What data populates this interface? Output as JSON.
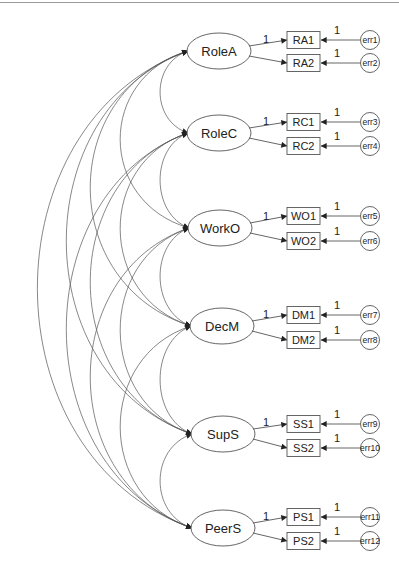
{
  "diagram": {
    "type": "structural-equation-model path diagram",
    "colors": {
      "stroke": "#555555",
      "arrow": "#222222",
      "text": "#222222",
      "background": "#ffffff"
    },
    "latents": [
      {
        "id": "RoleA",
        "label": "RoleA",
        "cx": 219,
        "cy": 51,
        "indicators": [
          {
            "label": "RA1",
            "y": 40,
            "loading": "1",
            "error": "err1",
            "error_weight": "1"
          },
          {
            "label": "RA2",
            "y": 63,
            "loading": "",
            "error": "err2",
            "error_weight": "1"
          }
        ]
      },
      {
        "id": "RoleC",
        "label": "RoleC",
        "cx": 219,
        "cy": 133,
        "indicators": [
          {
            "label": "RC1",
            "y": 122,
            "loading": "1",
            "error": "err3",
            "error_weight": "1"
          },
          {
            "label": "RC2",
            "y": 146,
            "loading": "",
            "error": "err4",
            "error_weight": "1"
          }
        ]
      },
      {
        "id": "WorkO",
        "label": "WorkO",
        "cx": 220,
        "cy": 228,
        "indicators": [
          {
            "label": "WO1",
            "y": 216,
            "loading": "1",
            "error": "err5",
            "error_weight": "1"
          },
          {
            "label": "WO2",
            "y": 241,
            "loading": "",
            "error": "err6",
            "error_weight": "1"
          }
        ]
      },
      {
        "id": "DecM",
        "label": "DecM",
        "cx": 222,
        "cy": 326,
        "indicators": [
          {
            "label": "DM1",
            "y": 315,
            "loading": "1",
            "error": "err7",
            "error_weight": "1"
          },
          {
            "label": "DM2",
            "y": 340,
            "loading": "",
            "error": "err8",
            "error_weight": "1"
          }
        ]
      },
      {
        "id": "SupS",
        "label": "SupS",
        "cx": 223,
        "cy": 434,
        "indicators": [
          {
            "label": "SS1",
            "y": 424,
            "loading": "1",
            "error": "err9",
            "error_weight": "1"
          },
          {
            "label": "SS2",
            "y": 448,
            "loading": "",
            "error": "err10",
            "error_weight": "1"
          }
        ]
      },
      {
        "id": "PeerS",
        "label": "PeerS",
        "cx": 223,
        "cy": 528,
        "indicators": [
          {
            "label": "PS1",
            "y": 517,
            "loading": "1",
            "error": "err11",
            "error_weight": "1"
          },
          {
            "label": "PS2",
            "y": 541,
            "loading": "",
            "error": "err12",
            "error_weight": "1"
          }
        ]
      }
    ],
    "covariances": [
      [
        "RoleA",
        "RoleC"
      ],
      [
        "RoleA",
        "WorkO"
      ],
      [
        "RoleA",
        "DecM"
      ],
      [
        "RoleA",
        "SupS"
      ],
      [
        "RoleA",
        "PeerS"
      ],
      [
        "RoleC",
        "WorkO"
      ],
      [
        "RoleC",
        "DecM"
      ],
      [
        "RoleC",
        "SupS"
      ],
      [
        "RoleC",
        "PeerS"
      ],
      [
        "WorkO",
        "DecM"
      ],
      [
        "WorkO",
        "SupS"
      ],
      [
        "WorkO",
        "PeerS"
      ],
      [
        "DecM",
        "SupS"
      ],
      [
        "DecM",
        "PeerS"
      ],
      [
        "SupS",
        "PeerS"
      ]
    ]
  }
}
